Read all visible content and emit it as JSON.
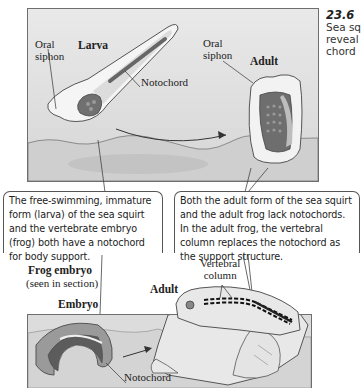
{
  "figure": {
    "number": "23.6",
    "caption_lines": [
      "Sea sq",
      "reveal",
      "chord"
    ]
  },
  "top_panel": {
    "larva_title": "Larva",
    "adult_title": "Adult",
    "larva_oral_siphon": [
      "Oral",
      "siphon"
    ],
    "adult_oral_siphon": [
      "Oral",
      "siphon"
    ],
    "notochord_label": "Notochord"
  },
  "callouts": {
    "left": "The free-swimming, immature form (larva) of the sea squirt and the vertebrate embryo (frog) both have a notochord for body support.",
    "right": "Both the adult form of the sea squirt and the adult frog lack notochords. In the adult frog, the vertebral column replaces the notochord as the support structure."
  },
  "bottom_panel": {
    "frog_embryo_title": "Frog embryo",
    "frog_embryo_subtitle": "(seen in section)",
    "embryo_title": "Embryo",
    "adult_title": "Adult",
    "vertebral_column_label": [
      "Vertebral",
      "column"
    ],
    "notochord_label": "Notochord"
  },
  "colors": {
    "panel_bg": "#dcdcdc",
    "dark_tissue": "#6a6a6a",
    "light_tissue": "#f2f2f2",
    "line": "#444444"
  }
}
